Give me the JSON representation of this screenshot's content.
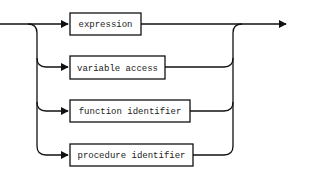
{
  "diagram": {
    "type": "railroad-syntax-diagram",
    "line_color": "#111111",
    "box_fill": "#ffffff",
    "alternatives": [
      {
        "label": "expression",
        "x": 70,
        "y": 13,
        "w": 71,
        "h": 22
      },
      {
        "label": "variable access",
        "x": 70,
        "y": 56,
        "w": 95,
        "h": 23
      },
      {
        "label": "function identifier",
        "x": 70,
        "y": 100,
        "w": 120,
        "h": 22
      },
      {
        "label": "procedure identifier",
        "x": 70,
        "y": 144,
        "w": 123,
        "h": 22
      }
    ],
    "entry": {
      "x": 0,
      "y": 24
    },
    "left_rail_x": 37,
    "right_rail_x": 233,
    "exit_arrow": {
      "x": 288,
      "y": 24
    }
  }
}
